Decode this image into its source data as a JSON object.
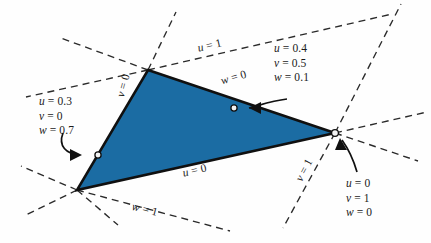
{
  "figure": {
    "colors": {
      "triangle_fill": "#1b6ca3",
      "triangle_stroke": "#101010",
      "dashed_line": "#2a2a2a",
      "background": "#fefefe",
      "text": "#1a1a1a"
    }
  },
  "edge_labels": {
    "u_equals_1": "u = 1",
    "w_equals_0": "w = 0",
    "v_equals_0": "v = 0",
    "u_equals_0": "u = 0",
    "w_equals_1": "w = 1",
    "v_equals_1": "v = 1"
  },
  "point_labels": {
    "interior_point": {
      "u": "u = 0.4",
      "v": "v = 0.5",
      "w": "w = 0.1"
    },
    "edge_point": {
      "u": "u = 0.3",
      "v": "v = 0",
      "w": "w = 0.7"
    },
    "vertex_point": {
      "u": "u = 0",
      "v": "v = 1",
      "w": "w = 0"
    }
  },
  "chart_data": {
    "type": "scatter",
    "xlabel": "",
    "ylabel": "",
    "xlim": [
      0,
      431
    ],
    "ylim": [
      243,
      0
    ],
    "grid": false,
    "legend": "none",
    "triangle_vertices": [
      {
        "name": "top",
        "x": 148,
        "y": 70
      },
      {
        "name": "bottom-left",
        "x": 77,
        "y": 190
      },
      {
        "name": "right",
        "x": 335,
        "y": 133
      }
    ],
    "annotated_points": [
      {
        "name": "interior-point",
        "x": 234,
        "y": 108,
        "u": 0.4,
        "v": 0.5,
        "w": 0.1
      },
      {
        "name": "edge-point",
        "x": 98,
        "y": 155,
        "u": 0.3,
        "v": 0.0,
        "w": 0.7
      },
      {
        "name": "vertex-point",
        "x": 335,
        "y": 133,
        "u": 0.0,
        "v": 1.0,
        "w": 0.0
      }
    ],
    "edge_lines": [
      {
        "label": "u = 1",
        "through": "top vertex, parallel to opposite edge"
      },
      {
        "label": "w = 0",
        "edge": "top to right vertex"
      },
      {
        "label": "v = 0",
        "edge": "top to bottom-left vertex"
      },
      {
        "label": "u = 0",
        "edge": "bottom-left to right vertex"
      },
      {
        "label": "w = 1",
        "through": "bottom-left vertex"
      },
      {
        "label": "v = 1",
        "through": "right vertex"
      }
    ]
  }
}
